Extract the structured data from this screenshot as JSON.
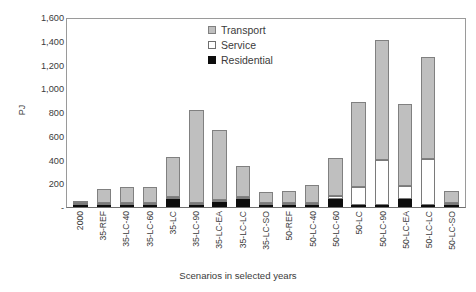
{
  "chart_data": {
    "type": "bar",
    "stacked": true,
    "title": "",
    "xlabel": "Scenarios in selected years",
    "ylabel": "PJ",
    "ylim": [
      0,
      1600
    ],
    "yticks": [
      0,
      200,
      400,
      600,
      800,
      1000,
      1200,
      1400,
      1600
    ],
    "ytick_labels": [
      "-",
      "200",
      "400",
      "600",
      "800",
      "1,000",
      "1,200",
      "1,400",
      "1,600"
    ],
    "grid": false,
    "legend_position": "top-center",
    "categories": [
      "2000",
      "35-REF",
      "35-LC-40",
      "35-LC-60",
      "35-LC",
      "35-LC-90",
      "35-LC-EA",
      "35-LC-LC",
      "35-LC-SO",
      "50-REF",
      "50-LC-40",
      "50-LC-60",
      "50-LC",
      "50-LC-90",
      "50-LC-EA",
      "50-LC-LC",
      "50-LC-SO"
    ],
    "series": [
      {
        "name": "Residential",
        "color": "#0d0d0d",
        "values": [
          2,
          5,
          8,
          8,
          70,
          10,
          40,
          70,
          5,
          5,
          8,
          70,
          10,
          10,
          70,
          10,
          5
        ]
      },
      {
        "name": "Service",
        "color": "#ffffff",
        "values": [
          2,
          3,
          4,
          4,
          15,
          20,
          15,
          10,
          3,
          3,
          4,
          20,
          150,
          380,
          110,
          390,
          4
        ]
      },
      {
        "name": "Transport",
        "color": "#bfbfbf",
        "values": [
          11,
          122,
          133,
          133,
          335,
          780,
          595,
          255,
          92,
          97,
          148,
          320,
          720,
          1010,
          685,
          860,
          101
        ]
      }
    ],
    "totals": [
      15,
      130,
      145,
      145,
      420,
      810,
      650,
      335,
      100,
      105,
      160,
      410,
      880,
      1400,
      865,
      1260,
      110
    ]
  },
  "legend": {
    "items": [
      {
        "label": "Transport",
        "swatch": "transport-swatch"
      },
      {
        "label": "Service",
        "swatch": "service-swatch"
      },
      {
        "label": "Residential",
        "swatch": "residential-swatch"
      }
    ]
  }
}
